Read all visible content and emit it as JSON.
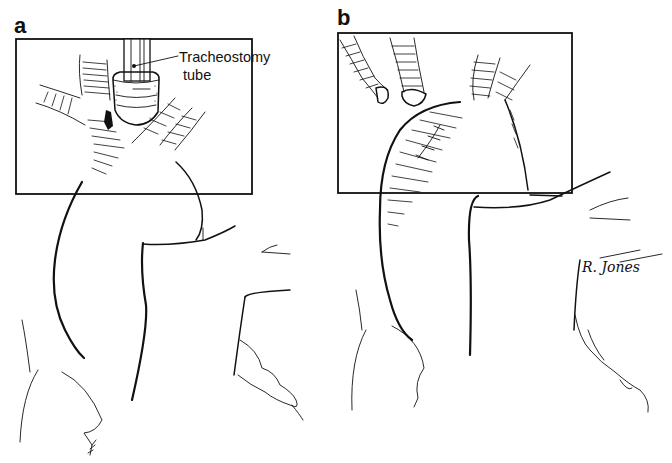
{
  "figure": {
    "panels": [
      {
        "id": "a",
        "label": "a",
        "callout": {
          "line1": "Tracheostomy",
          "line2": "tube"
        }
      },
      {
        "id": "b",
        "label": "b"
      }
    ],
    "signature": "R. Jones",
    "colors": {
      "ink": "#111111",
      "paper": "#ffffff"
    }
  }
}
